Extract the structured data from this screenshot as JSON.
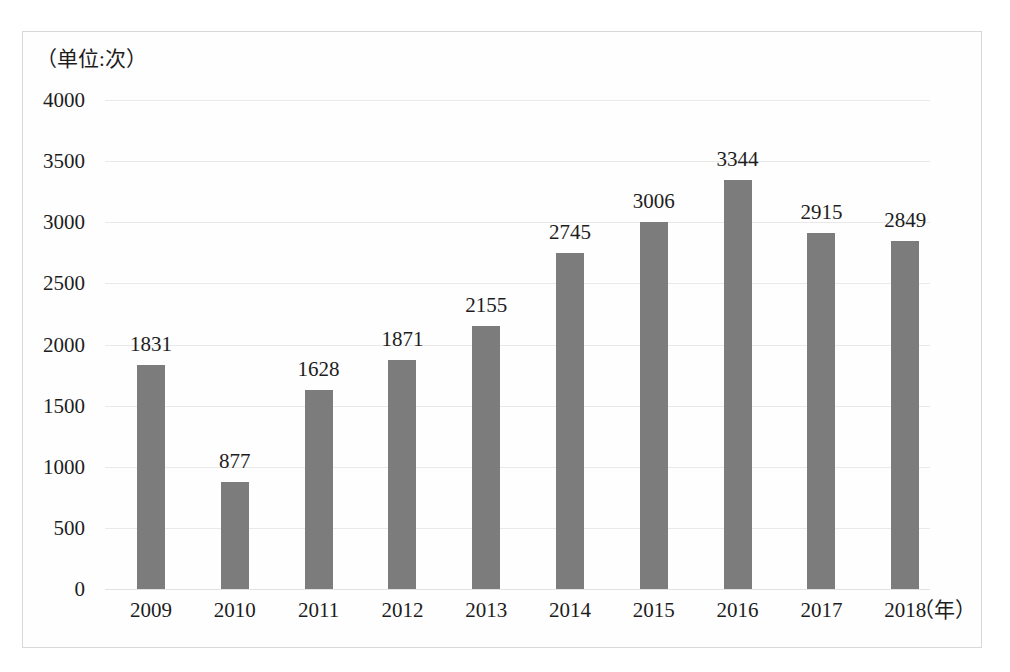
{
  "chart_data": {
    "type": "bar",
    "title": "",
    "subtitle": "",
    "unit_caption": "（单位:次）",
    "xlabel": "（年）",
    "ylabel": "",
    "categories": [
      "2009",
      "2010",
      "2011",
      "2012",
      "2013",
      "2014",
      "2015",
      "2016",
      "2017",
      "2018"
    ],
    "values": [
      1831,
      877,
      1628,
      1871,
      2155,
      2745,
      3006,
      3344,
      2915,
      2849
    ],
    "data_labels": [
      "1831",
      "877",
      "1628",
      "1871",
      "2155",
      "2745",
      "3006",
      "3344",
      "2915",
      "2849"
    ],
    "ylim": [
      0,
      4000
    ],
    "ytick_values": [
      0,
      500,
      1000,
      1500,
      2000,
      2500,
      3000,
      3500,
      4000
    ],
    "ytick_labels": [
      "0",
      "500",
      "1000",
      "1500",
      "2000",
      "2500",
      "3000",
      "3500",
      "4000"
    ],
    "grid": true,
    "grid_axis": "y",
    "legend": false,
    "legend_position": "none",
    "bar_color": "#7c7c7c",
    "grid_color": "#e9e9e9",
    "text_color": "#1d1d1d",
    "frame_color": "#d8d8d8",
    "show_data_labels": true
  }
}
